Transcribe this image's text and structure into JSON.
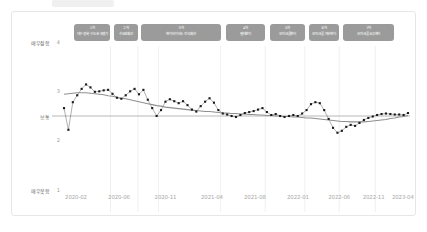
{
  "card": {
    "background": "#ffffff",
    "border_color": "#e6e6e6"
  },
  "colors": {
    "wave_box_fill": "#9b9b9b",
    "wave_box_text": "#ffffff",
    "point": "#1a1a1a",
    "series_line": "#555555",
    "trend_line": "#8f8f8f",
    "reference_line": "#b0b0b0",
    "gridline": "#ececec",
    "axis_text": "#a8a8a8",
    "category_text": "#6b6b6b"
  },
  "waves": [
    {
      "id": "wave-1",
      "number": "1차",
      "desc": "대구·경북 수도권 유행기"
    },
    {
      "id": "wave-2",
      "number": "2차",
      "desc": "수도권확산"
    },
    {
      "id": "wave-3",
      "number": "3차",
      "desc": "변이바이러스 전국확산"
    },
    {
      "id": "wave-4",
      "number": "4차",
      "desc": "델타변이"
    },
    {
      "id": "wave-5",
      "number": "5차",
      "desc": "오미크론변이"
    },
    {
      "id": "wave-6",
      "number": "6차",
      "desc": "오미크론 하위변이"
    },
    {
      "id": "wave-7",
      "number": "7차",
      "desc": "오미크론 BQ변이"
    }
  ],
  "chart_data": {
    "type": "scatter",
    "title": "",
    "xlabel": "",
    "ylabel": "",
    "ylim": [
      1,
      4
    ],
    "grid": true,
    "legend_position": "none",
    "y_category_labels": [
      {
        "value": 4,
        "label": "매우잘함"
      },
      {
        "value": 2.5,
        "label": "보통"
      },
      {
        "value": 1,
        "label": "매우못함"
      }
    ],
    "y_ticks": [
      {
        "value": 4,
        "label": "4"
      },
      {
        "value": 3,
        "label": "3"
      },
      {
        "value": 2,
        "label": "2"
      },
      {
        "value": 1,
        "label": "1"
      }
    ],
    "x_ticks": [
      "2020-02",
      "2020-06",
      "2020-11",
      "2021-04",
      "2021-08",
      "2022-01",
      "2022-06",
      "2022-11",
      "2023-04"
    ],
    "reference_line_y": 2.5,
    "series": [
      {
        "name": "정부 코로나19 대응 평가",
        "x": [
          "2020-02-01",
          "2020-02-15",
          "2020-03-01",
          "2020-03-15",
          "2020-04-01",
          "2020-04-15",
          "2020-05-01",
          "2020-05-15",
          "2020-06-01",
          "2020-06-15",
          "2020-07-01",
          "2020-07-15",
          "2020-08-01",
          "2020-08-15",
          "2020-09-01",
          "2020-09-15",
          "2020-10-01",
          "2020-10-15",
          "2020-11-01",
          "2020-11-15",
          "2020-12-01",
          "2020-12-15",
          "2021-01-01",
          "2021-01-15",
          "2021-02-01",
          "2021-02-15",
          "2021-03-01",
          "2021-03-15",
          "2021-04-01",
          "2021-04-15",
          "2021-05-01",
          "2021-05-15",
          "2021-06-01",
          "2021-06-15",
          "2021-07-01",
          "2021-07-15",
          "2021-08-01",
          "2021-08-15",
          "2021-09-01",
          "2021-09-15",
          "2021-10-01",
          "2021-10-15",
          "2021-11-01",
          "2021-11-15",
          "2021-12-01",
          "2021-12-15",
          "2022-01-01",
          "2022-01-15",
          "2022-02-01",
          "2022-02-15",
          "2022-03-01",
          "2022-03-15",
          "2022-04-01",
          "2022-04-15",
          "2022-05-01",
          "2022-05-15",
          "2022-06-01",
          "2022-06-15",
          "2022-07-01",
          "2022-07-15",
          "2022-08-01",
          "2022-08-15",
          "2022-09-01",
          "2022-09-15",
          "2022-10-01",
          "2022-10-15",
          "2022-11-01",
          "2022-11-15",
          "2022-12-01",
          "2022-12-15",
          "2023-01-01",
          "2023-01-15",
          "2023-02-01",
          "2023-02-15",
          "2023-03-01",
          "2023-03-15",
          "2023-04-01",
          "2023-04-15",
          "2023-05-01"
        ],
        "values": [
          2.66,
          2.22,
          2.78,
          2.92,
          3.05,
          3.14,
          3.08,
          2.99,
          3.0,
          3.02,
          3.03,
          2.95,
          2.87,
          2.85,
          2.92,
          3.0,
          3.05,
          2.94,
          3.03,
          2.83,
          2.66,
          2.5,
          2.62,
          2.79,
          2.84,
          2.8,
          2.76,
          2.8,
          2.72,
          2.63,
          2.59,
          2.7,
          2.79,
          2.86,
          2.77,
          2.62,
          2.55,
          2.53,
          2.5,
          2.48,
          2.52,
          2.56,
          2.58,
          2.6,
          2.63,
          2.66,
          2.58,
          2.52,
          2.54,
          2.5,
          2.48,
          2.5,
          2.52,
          2.5,
          2.55,
          2.62,
          2.74,
          2.78,
          2.76,
          2.62,
          2.44,
          2.26,
          2.16,
          2.2,
          2.28,
          2.32,
          2.3,
          2.36,
          2.42,
          2.46,
          2.49,
          2.52,
          2.54,
          2.55,
          2.54,
          2.53,
          2.53,
          2.52,
          2.56
        ]
      }
    ],
    "trend_line": {
      "name": "LOESS 추세선",
      "values": [
        2.94,
        2.95,
        2.96,
        2.97,
        2.97,
        2.97,
        2.96,
        2.95,
        2.94,
        2.93,
        2.91,
        2.9,
        2.88,
        2.86,
        2.85,
        2.83,
        2.81,
        2.79,
        2.77,
        2.75,
        2.73,
        2.71,
        2.7,
        2.68,
        2.67,
        2.66,
        2.65,
        2.64,
        2.63,
        2.62,
        2.61,
        2.6,
        2.59,
        2.59,
        2.58,
        2.57,
        2.56,
        2.56,
        2.55,
        2.55,
        2.54,
        2.54,
        2.53,
        2.53,
        2.52,
        2.52,
        2.51,
        2.51,
        2.5,
        2.5,
        2.49,
        2.49,
        2.48,
        2.48,
        2.47,
        2.46,
        2.46,
        2.45,
        2.44,
        2.43,
        2.42,
        2.41,
        2.4,
        2.39,
        2.39,
        2.38,
        2.38,
        2.38,
        2.38,
        2.39,
        2.4,
        2.41,
        2.42,
        2.43,
        2.45,
        2.46,
        2.48,
        2.49,
        2.51
      ]
    }
  }
}
